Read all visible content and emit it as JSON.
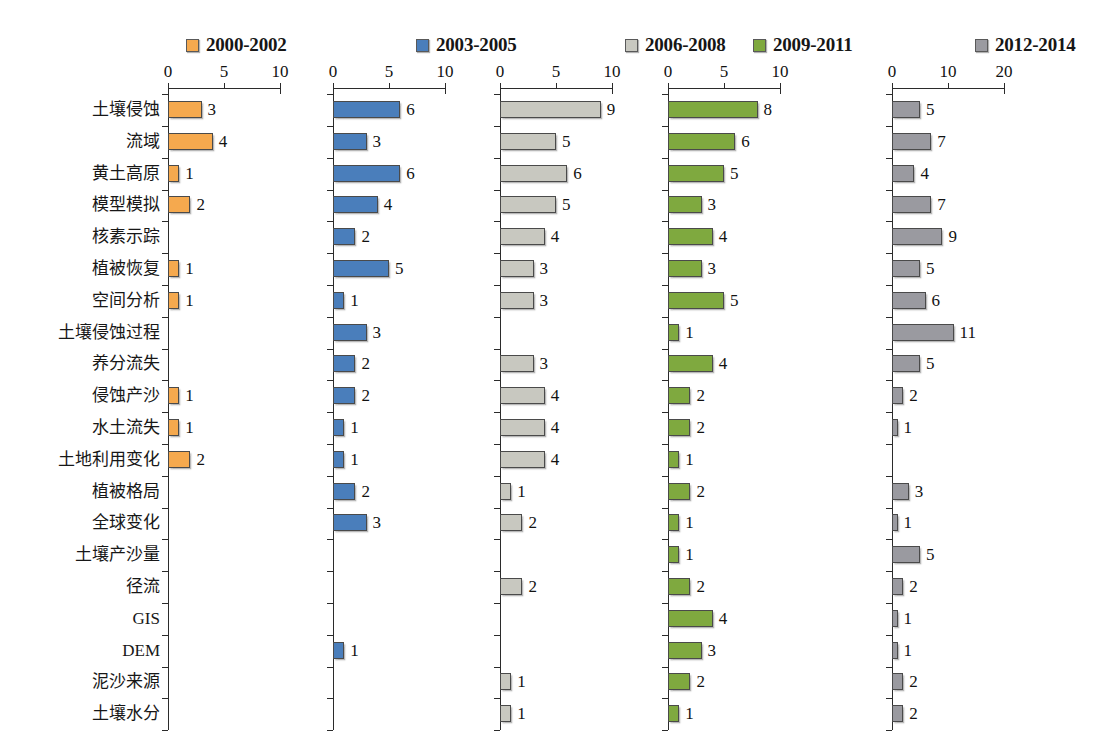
{
  "chart_data": {
    "type": "bar",
    "title": "",
    "subtitle": "",
    "xlabel": "",
    "ylabel": "",
    "orientation": "horizontal",
    "grid": false,
    "legend_position": "top",
    "categories": [
      "土壤侵蚀",
      "流域",
      "黄土高原",
      "模型模拟",
      "核素示踪",
      "植被恢复",
      "空间分析",
      "土壤侵蚀过程",
      "养分流失",
      "侵蚀产沙",
      "水土流失",
      "土地利用变化",
      "植被格局",
      "全球变化",
      "土壤产沙量",
      "径流",
      "GIS",
      "DEM",
      "泥沙来源",
      "土壤水分"
    ],
    "panels": [
      {
        "name": "2000-2002",
        "legend_label": "2000-2002",
        "color": "#F5A94E",
        "xlim": [
          0,
          10
        ],
        "xticks": [
          0,
          5,
          10
        ],
        "xtick_labels": [
          "0",
          "5",
          "10"
        ],
        "values": [
          3,
          4,
          1,
          2,
          0,
          1,
          1,
          0,
          0,
          1,
          1,
          2,
          0,
          0,
          0,
          0,
          0,
          0,
          0,
          0
        ],
        "value_labels": [
          "3",
          "4",
          "1",
          "2",
          "",
          "1",
          "1",
          "",
          "",
          "1",
          "1",
          "2",
          "",
          "",
          "",
          "",
          "",
          "",
          "",
          ""
        ]
      },
      {
        "name": "2003-2005",
        "legend_label": "2003-2005",
        "color": "#4A7EBB",
        "xlim": [
          0,
          10
        ],
        "xticks": [
          0,
          5,
          10
        ],
        "xtick_labels": [
          "0",
          "5",
          "10"
        ],
        "values": [
          6,
          3,
          6,
          4,
          2,
          5,
          1,
          3,
          2,
          2,
          1,
          1,
          2,
          3,
          0,
          0,
          0,
          1,
          0,
          0
        ],
        "value_labels": [
          "6",
          "3",
          "6",
          "4",
          "2",
          "5",
          "1",
          "3",
          "2",
          "2",
          "1",
          "1",
          "2",
          "3",
          "",
          "",
          "",
          "1",
          "",
          ""
        ]
      },
      {
        "name": "2006-2008",
        "legend_label": "2006-2008",
        "color": "#C8C8C0",
        "xlim": [
          0,
          10
        ],
        "xticks": [
          0,
          5,
          10
        ],
        "xtick_labels": [
          "0",
          "5",
          "10"
        ],
        "values": [
          9,
          5,
          6,
          5,
          4,
          3,
          3,
          0,
          3,
          4,
          4,
          4,
          1,
          2,
          0,
          2,
          0,
          0,
          1,
          1
        ],
        "value_labels": [
          "9",
          "5",
          "6",
          "5",
          "4",
          "3",
          "3",
          "",
          "3",
          "4",
          "4",
          "4",
          "1",
          "2",
          "",
          "2",
          "",
          "",
          "1",
          "1"
        ]
      },
      {
        "name": "2009-2011",
        "legend_label": "2009-2011",
        "color": "#7FA93F",
        "xlim": [
          0,
          10
        ],
        "xticks": [
          0,
          5,
          10
        ],
        "xtick_labels": [
          "0",
          "5",
          "10"
        ],
        "values": [
          8,
          6,
          5,
          3,
          4,
          3,
          5,
          1,
          4,
          2,
          2,
          1,
          2,
          1,
          1,
          2,
          4,
          3,
          2,
          1
        ],
        "value_labels": [
          "8",
          "6",
          "5",
          "3",
          "4",
          "3",
          "5",
          "1",
          "4",
          "2",
          "2",
          "1",
          "2",
          "1",
          "1",
          "2",
          "4",
          "3",
          "2",
          "1"
        ]
      },
      {
        "name": "2012-2014",
        "legend_label": "2012-2014",
        "color": "#9A9AA0",
        "xlim": [
          0,
          20
        ],
        "xticks": [
          0,
          10,
          20
        ],
        "xtick_labels": [
          "0",
          "10",
          "20"
        ],
        "values": [
          5,
          7,
          4,
          7,
          9,
          5,
          6,
          11,
          5,
          2,
          1,
          0,
          3,
          1,
          5,
          2,
          1,
          1,
          2,
          2
        ],
        "value_labels": [
          "5",
          "7",
          "4",
          "7",
          "9",
          "5",
          "6",
          "11",
          "5",
          "2",
          "1",
          "",
          "3",
          "1",
          "5",
          "2",
          "1",
          "1",
          "2",
          "2"
        ]
      }
    ]
  },
  "legend": {
    "items": [
      {
        "label": "2000-2002",
        "color": "#F5A94E"
      },
      {
        "label": "2003-2005",
        "color": "#4A7EBB"
      },
      {
        "label": "2006-2008",
        "color": "#C8C8C0"
      },
      {
        "label": "2009-2011",
        "color": "#7FA93F"
      },
      {
        "label": "2012-2014",
        "color": "#9A9AA0"
      }
    ]
  }
}
